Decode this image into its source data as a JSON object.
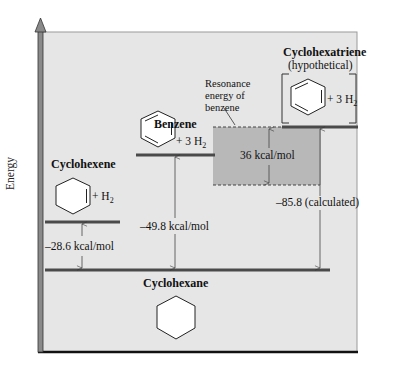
{
  "diagram": {
    "axis_label": "Energy",
    "colors": {
      "panel_bg": "#e6e6e6",
      "level_line": "#4a4a4a",
      "axis": "#8a8a8a",
      "resonance_box": "#b8b8b8",
      "text": "#111111"
    },
    "species": {
      "cyclohexene": {
        "name": "Cyclohexene",
        "reagent": "+ H",
        "sub": "2"
      },
      "benzene": {
        "name": "Benzene",
        "reagent": "+ 3 H",
        "sub": "2"
      },
      "cyclohexatriene": {
        "name": "Cyclohexatriene",
        "note": "(hypothetical)",
        "reagent": "+ 3 H",
        "sub": "2"
      },
      "cyclohexane": {
        "name": "Cyclohexane"
      }
    },
    "energies": {
      "cyclohexene_to_cyclohexane": "–28.6 kcal/mol",
      "benzene_to_cyclohexane": "–49.8 kcal/mol",
      "cyclohexatriene_to_cyclohexane": "–85.8 (calculated)",
      "resonance": "36 kcal/mol"
    },
    "resonance_label": [
      "Resonance",
      "energy of",
      "benzene"
    ]
  }
}
